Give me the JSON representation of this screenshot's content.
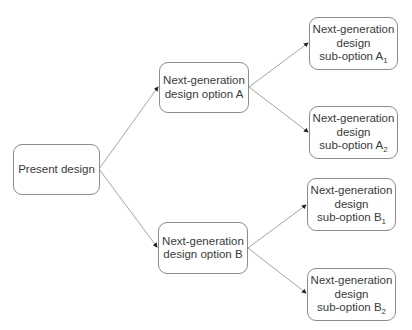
{
  "diagram": {
    "type": "tree",
    "colors": {
      "border": "#8c8c8c",
      "edge": "#8c8c8c",
      "text": "#3a3a3a",
      "background": "#ffffff"
    },
    "nodes": {
      "present": {
        "label": "Present design"
      },
      "optA": {
        "line1": "Next-generation",
        "line2": "design option A"
      },
      "optB": {
        "line1": "Next-generation",
        "line2": "design option B"
      },
      "subA1": {
        "line1": "Next-generation",
        "line2": "design",
        "line3": "sub-option A",
        "sub": "1"
      },
      "subA2": {
        "line1": "Next-generation",
        "line2": "design",
        "line3": "sub-option A",
        "sub": "2"
      },
      "subB1": {
        "line1": "Next-generation",
        "line2": "design",
        "line3": "sub-option B",
        "sub": "1"
      },
      "subB2": {
        "line1": "Next-generation",
        "line2": "design",
        "line3": "sub-option B",
        "sub": "2"
      }
    },
    "edges": [
      {
        "from": "present",
        "to": "optA"
      },
      {
        "from": "present",
        "to": "optB"
      },
      {
        "from": "optA",
        "to": "subA1"
      },
      {
        "from": "optA",
        "to": "subA2"
      },
      {
        "from": "optB",
        "to": "subB1"
      },
      {
        "from": "optB",
        "to": "subB2"
      }
    ]
  }
}
